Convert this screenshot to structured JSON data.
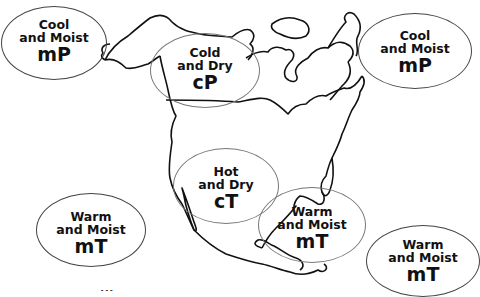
{
  "map": {
    "subject": "North American air masses",
    "air_masses": [
      {
        "id": "mp-pacific",
        "line1": "Cool",
        "line2": "and Moist",
        "code": "mP"
      },
      {
        "id": "cp-canada",
        "line1": "Cold",
        "line2": "and Dry",
        "code": "cP"
      },
      {
        "id": "mp-atlantic",
        "line1": "Cool",
        "line2": "and Moist",
        "code": "mP"
      },
      {
        "id": "ct-southwest",
        "line1": "Hot",
        "line2": "and Dry",
        "code": "cT"
      },
      {
        "id": "mt-pacific",
        "line1": "Warm",
        "line2": "and Moist",
        "code": "mT"
      },
      {
        "id": "mt-gulf",
        "line1": "Warm",
        "line2": "and Moist",
        "code": "mT"
      },
      {
        "id": "mt-atlantic",
        "line1": "Warm",
        "line2": "and Moist",
        "code": "mT"
      }
    ],
    "caption": "..."
  }
}
